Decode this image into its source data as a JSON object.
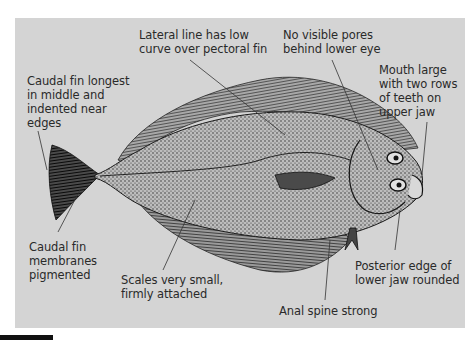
{
  "diagram": {
    "background_color": "#d4d4d4",
    "labels": [
      {
        "id": "lateral-line",
        "text": "Lateral line has low\ncurve over pectoral fin"
      },
      {
        "id": "pores",
        "text": "No visible pores\nbehind lower eye"
      },
      {
        "id": "mouth",
        "text": "Mouth large\nwith two rows\nof teeth on\nupper jaw"
      },
      {
        "id": "caudal-shape",
        "text": "Caudal fin longest\nin middle and\nindented near\nedges"
      },
      {
        "id": "caudal-membranes",
        "text": "Caudal fin\nmembranes\npigmented"
      },
      {
        "id": "scales",
        "text": "Scales very small,\nfirmly attached"
      },
      {
        "id": "jaw-edge",
        "text": "Posterior edge of\nlower jaw rounded"
      },
      {
        "id": "anal-spine",
        "text": "Anal spine strong"
      }
    ]
  }
}
